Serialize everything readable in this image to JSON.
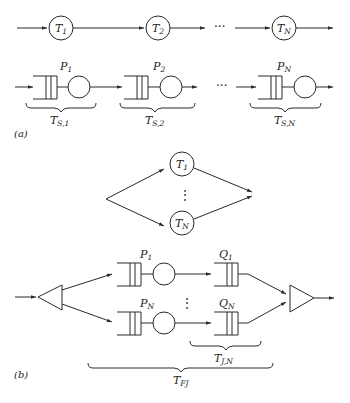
{
  "figure": {
    "part_a": {
      "tag": "(a)",
      "tandem_nodes": [
        {
          "label": "T",
          "sub": "1"
        },
        {
          "label": "T",
          "sub": "2"
        },
        {
          "label": "T",
          "sub": "N"
        }
      ],
      "ellipsis": "···",
      "queue_stations": [
        {
          "label": "P",
          "sub": "1",
          "brace_label": "T",
          "brace_sub": "S,1"
        },
        {
          "label": "P",
          "sub": "2",
          "brace_label": "T",
          "brace_sub": "S,2"
        },
        {
          "label": "P",
          "sub": "N",
          "brace_label": "T",
          "brace_sub": "S,N"
        }
      ]
    },
    "part_b": {
      "tag": "(b)",
      "parallel_nodes": [
        {
          "label": "T",
          "sub": "1"
        },
        {
          "label": "T",
          "sub": "N"
        }
      ],
      "vertical_ellipsis": "⋮",
      "servers": [
        {
          "label": "P",
          "sub": "1"
        },
        {
          "label": "P",
          "sub": "N"
        }
      ],
      "join_queues": [
        {
          "label": "Q",
          "sub": "1"
        },
        {
          "label": "Q",
          "sub": "N"
        }
      ],
      "brace_join": {
        "label": "T",
        "sub": "J,N"
      },
      "brace_total": {
        "label": "T",
        "sub": "FJ"
      },
      "fork_icon": "fork-triangle",
      "join_icon": "join-triangle"
    }
  }
}
